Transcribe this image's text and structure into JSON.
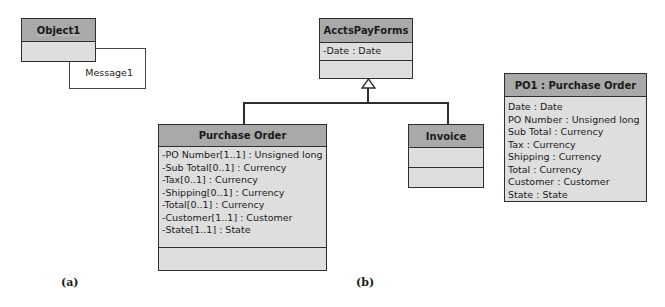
{
  "part_a": {
    "object": {
      "name": "Object1"
    },
    "message": {
      "label": "Message1"
    },
    "caption": "(a)"
  },
  "part_b": {
    "superclass": {
      "name": "AcctsPayForms",
      "attributes": [
        "-Date : Date"
      ]
    },
    "subclasses": [
      {
        "name": "Purchase Order",
        "attributes": [
          "-PO Number[1..1] : Unsigned long",
          "-Sub Total[0..1] : Currency",
          "-Tax[0..1] : Currency",
          "-Shipping[0..1] : Currency",
          "-Total[0..1] : Currency",
          "-Customer[1..1] : Customer",
          "-State[1..1] : State"
        ]
      },
      {
        "name": "Invoice",
        "attributes": []
      }
    ],
    "instance": {
      "name": "PO1 : Purchase Order",
      "attributes": [
        "Date : Date",
        "PO Number : Unsigned long",
        "Sub Total : Currency",
        "Tax : Currency",
        "Shipping : Currency",
        "Total : Currency",
        "Customer : Customer",
        "State : State"
      ]
    },
    "caption": "(b)"
  }
}
